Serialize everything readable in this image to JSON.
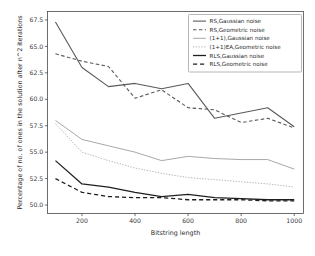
{
  "chart_data": {
    "type": "line",
    "title": "",
    "xlabel": "Bitstring length",
    "ylabel": "Percentage of no. of ones in the solution after n^2 iterations",
    "xlim": [
      70,
      1035
    ],
    "ylim": [
      49.2,
      68.3
    ],
    "xticks": [
      200,
      400,
      600,
      800,
      1000
    ],
    "xtick_labels": [
      "200",
      "400",
      "600",
      "800",
      "1000"
    ],
    "yticks": [
      50.0,
      52.5,
      55.0,
      57.5,
      60.0,
      62.5,
      65.0,
      67.5
    ],
    "ytick_labels": [
      "50.0",
      "52.5",
      "55.0",
      "57.5",
      "60.0",
      "62.5",
      "65.0",
      "67.5"
    ],
    "grid": false,
    "legend_position": "upper right",
    "x": [
      100,
      200,
      300,
      400,
      500,
      600,
      700,
      800,
      900,
      1000
    ],
    "series": [
      {
        "name": "RS,Gaussian noise",
        "color": "#5a5a5a",
        "style": "solid",
        "width": 1.1,
        "values": [
          67.3,
          63.0,
          61.2,
          61.5,
          61.0,
          61.5,
          58.2,
          58.7,
          59.2,
          57.4
        ]
      },
      {
        "name": "RS,Geometric noise",
        "color": "#5a5a5a",
        "style": "dashed",
        "width": 1.1,
        "values": [
          64.3,
          63.6,
          63.1,
          60.1,
          60.9,
          59.2,
          59.0,
          57.8,
          58.2,
          57.3
        ]
      },
      {
        "name": "(1+1),Gaussian noise",
        "color": "#a8a8a8",
        "style": "solid",
        "width": 1.0,
        "values": [
          58.0,
          56.2,
          55.6,
          55.0,
          54.2,
          54.6,
          54.4,
          54.3,
          54.3,
          53.4
        ]
      },
      {
        "name": "(1+1)EA,Geometric noise",
        "color": "#b4b4b4",
        "style": "dotted",
        "width": 1.0,
        "values": [
          57.7,
          55.0,
          54.2,
          53.5,
          53.0,
          52.6,
          52.4,
          52.2,
          52.0,
          51.7
        ]
      },
      {
        "name": "RLS,Gaussian noise",
        "color": "#1f1f1f",
        "style": "solid",
        "width": 1.3,
        "values": [
          54.2,
          52.0,
          51.7,
          51.2,
          50.8,
          51.0,
          50.7,
          50.6,
          50.5,
          50.5
        ]
      },
      {
        "name": "RLS,Geometric noise",
        "color": "#1f1f1f",
        "style": "dashed",
        "width": 1.3,
        "values": [
          52.5,
          51.2,
          50.8,
          50.7,
          50.7,
          50.5,
          50.5,
          50.5,
          50.4,
          50.4
        ]
      }
    ]
  },
  "legend": {
    "items": [
      "RS,Gaussian noise",
      "RS,Geometric noise",
      "(1+1),Gaussian noise",
      "(1+1)EA,Geometric noise",
      "RLS,Gaussian noise",
      "RLS,Geometric noise"
    ]
  }
}
